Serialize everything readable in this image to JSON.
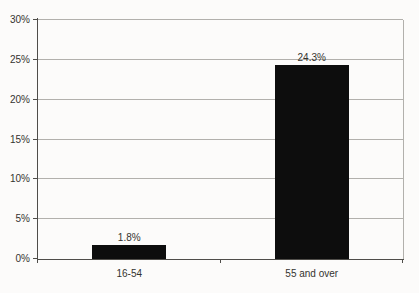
{
  "chart_data": {
    "type": "bar",
    "title": "",
    "xlabel": "",
    "ylabel": "",
    "categories": [
      "16-54",
      "55 and over"
    ],
    "values": [
      1.8,
      24.3
    ],
    "value_labels": [
      "1.8%",
      "24.3%"
    ],
    "ylim": [
      0,
      30
    ],
    "ytick_step": 5,
    "ytick_labels": [
      "0%",
      "5%",
      "10%",
      "15%",
      "20%",
      "25%",
      "30%"
    ],
    "grid": "horizontal",
    "legend": "none",
    "bar_color": "#0d0d0d",
    "gridline_color": "#b2b0ac",
    "axis_color": "#4f4d49",
    "text_color": "#34332f",
    "background_color": "#fcfbfa"
  }
}
